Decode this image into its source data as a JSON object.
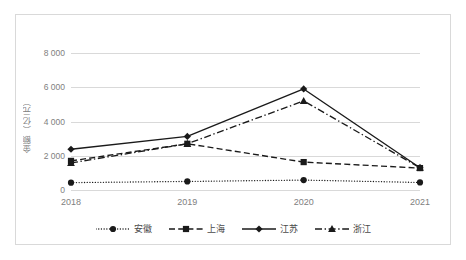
{
  "chart_data": {
    "type": "line",
    "title": "",
    "xlabel": "",
    "ylabel": "金额（亿元）",
    "categories": [
      "2018",
      "2019",
      "2020",
      "2021"
    ],
    "x": [
      2018,
      2019,
      2020,
      2021
    ],
    "ylim": [
      0,
      8000
    ],
    "ytick_values": [
      0,
      2000,
      4000,
      6000,
      8000
    ],
    "ytick_labels": [
      "0",
      "2 000",
      "4 000",
      "6 000",
      "8 000"
    ],
    "grid": true,
    "legend_position": "bottom",
    "series": [
      {
        "name": "安徽",
        "values": [
          430,
          500,
          580,
          440
        ],
        "line_style": "dotted",
        "marker": "circle",
        "color": "#1a1a1a"
      },
      {
        "name": "上海",
        "values": [
          1700,
          2700,
          1630,
          1280
        ],
        "line_style": "dashed",
        "marker": "square",
        "color": "#1a1a1a"
      },
      {
        "name": "江苏",
        "values": [
          2380,
          3130,
          5900,
          1300
        ],
        "line_style": "solid",
        "marker": "diamond",
        "color": "#1a1a1a"
      },
      {
        "name": "浙江",
        "values": [
          1580,
          2700,
          5200,
          1300
        ],
        "line_style": "dashdot",
        "marker": "triangle",
        "color": "#1a1a1a"
      }
    ]
  },
  "axis": {
    "y_label": "金额（亿元）",
    "y_ticks": [
      "8 000",
      "6 000",
      "4 000",
      "2 000",
      "0"
    ],
    "x_ticks": [
      "2018",
      "2019",
      "2020",
      "2021"
    ]
  },
  "legend": {
    "items": [
      {
        "label": "安徽"
      },
      {
        "label": "上海"
      },
      {
        "label": "江苏"
      },
      {
        "label": "浙江"
      }
    ]
  },
  "colors": {
    "grid": "#d9d9d9",
    "frame": "#d9d9d9",
    "series": "#1a1a1a",
    "tick_text": "#808080",
    "legend_text": "#4a4a4a",
    "background": "#ffffff"
  }
}
